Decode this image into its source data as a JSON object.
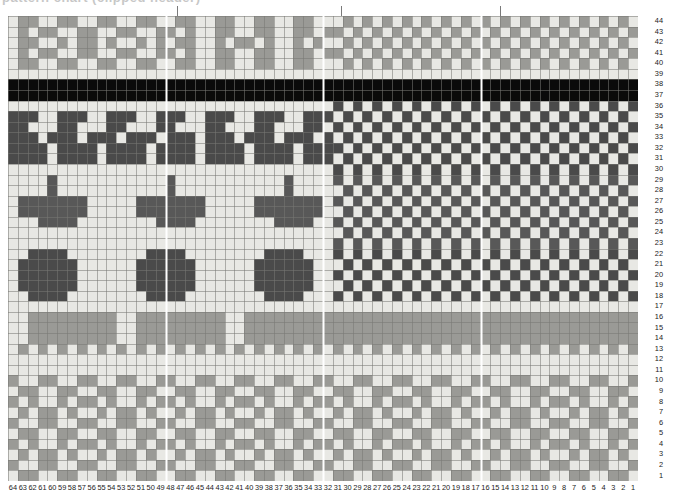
{
  "title": "pattern chart (clipped header)",
  "chart_data": {
    "type": "heatmap",
    "xlabel": "",
    "ylabel": "",
    "grid": true,
    "legend_position": "none",
    "orientation": "rows numbered bottom-to-top, columns numbered right-to-left",
    "rows": 44,
    "columns": 64,
    "row_labels": [
      44,
      43,
      42,
      41,
      40,
      39,
      38,
      37,
      36,
      35,
      34,
      33,
      32,
      31,
      30,
      29,
      28,
      27,
      26,
      25,
      24,
      23,
      22,
      21,
      20,
      19,
      18,
      17,
      16,
      15,
      14,
      13,
      12,
      11,
      10,
      9,
      8,
      7,
      6,
      5,
      4,
      3,
      2,
      1
    ],
    "column_labels": [
      64,
      63,
      62,
      61,
      60,
      59,
      58,
      57,
      56,
      55,
      54,
      53,
      52,
      51,
      50,
      49,
      48,
      47,
      46,
      45,
      44,
      43,
      42,
      41,
      40,
      39,
      38,
      37,
      36,
      35,
      34,
      33,
      32,
      31,
      30,
      29,
      28,
      27,
      26,
      25,
      24,
      23,
      22,
      21,
      20,
      19,
      18,
      17,
      16,
      15,
      14,
      13,
      12,
      11,
      10,
      9,
      8,
      7,
      6,
      5,
      4,
      3,
      2,
      1
    ],
    "palette": {
      "light": "#d8d8d4",
      "cream": "#e8e8e4",
      "mid": "#9a9a96",
      "dark": "#585858",
      "darker": "#4a4a4a",
      "black": "#0a0a0a",
      "gridline": "#8a8a86",
      "divider": "#ffffff"
    },
    "color_key": {
      "0": "light",
      "1": "mid",
      "2": "dark",
      "3": "black",
      "4": "cream"
    },
    "vertical_dividers_after_column": [
      49,
      33,
      17
    ],
    "tick_marks_x": [
      177,
      341,
      500
    ],
    "grid_geometry": {
      "left": 8,
      "top": 16,
      "width": 630,
      "height": 465,
      "cell_w": 9.84,
      "cell_h": 10.57
    },
    "matrix": [
      "0000000000000000000000000000000000000000000000000000000000000000",
      "0110011001100110011001100110011001100110011001100110011001100110",
      "0000000000000000000000000000000000000000000000000000000000000000",
      "1001100110011001100110011001100110011001100110011001100110011001",
      "0000000000000000000000000000000000000000000000000000000000000000",
      "0110011001100110011001100110011001100110011001100110011001100110",
      "0000000000000000000000000000000000000000000000000000000000000000",
      "1001100110011001100110011001100110011001100110011001100110011001",
      "0000000000000000000000000000000000000000000000000000000000000000",
      "0000000000000000000000000000000000000000000000000000000000000000",
      "0110011001100110011001100110011001100110011001100110011001100110",
      "0110011001100110011001100110011001100110011001100110011001100110",
      "0000000000000000000000000000000000000000000000000000000000000000",
      "1111111111111111111111111111111111111111111111111111111111111111",
      "0000000000000000000000000000000000000000000000000000000000000000",
      "0220022002200220022002200220022002200220022002200220022002200220",
      "2200220022002200220022002200220022002200220022002200220022002200",
      "0220022002200220022002200220022002200220022002200220022002200220",
      "2200220022002200220022002200220022002200220022002200220022002200",
      "0000000000000000000000000000000000000000000000000000000000000000",
      "3333333333333333333333333333333333333333333333333333333333333333",
      "3333333333333333333333333333333333333333333333333333333333333333",
      "0000000000000000000000000000000000000000000000000000000000000000",
      "0220022002200220022002200220022002200220022002200220022002200220",
      "2200220022002200220022002200220022002200220022002200220022002200",
      "0220022002200220022002200220022002200220022002200220022002200220",
      "0000000000000000000000000000000000000000000000000000000000000000"
    ]
  },
  "row_numbers": [
    "44",
    "43",
    "42",
    "41",
    "40",
    "39",
    "38",
    "37",
    "36",
    "35",
    "34",
    "33",
    "32",
    "31",
    "30",
    "29",
    "28",
    "27",
    "26",
    "25",
    "24",
    "23",
    "22",
    "21",
    "20",
    "19",
    "18",
    "17",
    "16",
    "15",
    "14",
    "13",
    "12",
    "11",
    "10",
    "9",
    "8",
    "7",
    "6",
    "5",
    "4",
    "3",
    "2",
    "1"
  ],
  "col_numbers": [
    "64",
    "63",
    "62",
    "61",
    "60",
    "59",
    "58",
    "57",
    "56",
    "55",
    "54",
    "53",
    "52",
    "51",
    "50",
    "49",
    "48",
    "47",
    "46",
    "45",
    "44",
    "43",
    "42",
    "41",
    "40",
    "39",
    "38",
    "37",
    "36",
    "35",
    "34",
    "33",
    "32",
    "31",
    "30",
    "29",
    "28",
    "27",
    "26",
    "25",
    "24",
    "23",
    "22",
    "21",
    "20",
    "19",
    "18",
    "17",
    "16",
    "15",
    "14",
    "13",
    "12",
    "11",
    "10",
    "9",
    "8",
    "7",
    "6",
    "5",
    "4",
    "3",
    "2",
    "1"
  ]
}
